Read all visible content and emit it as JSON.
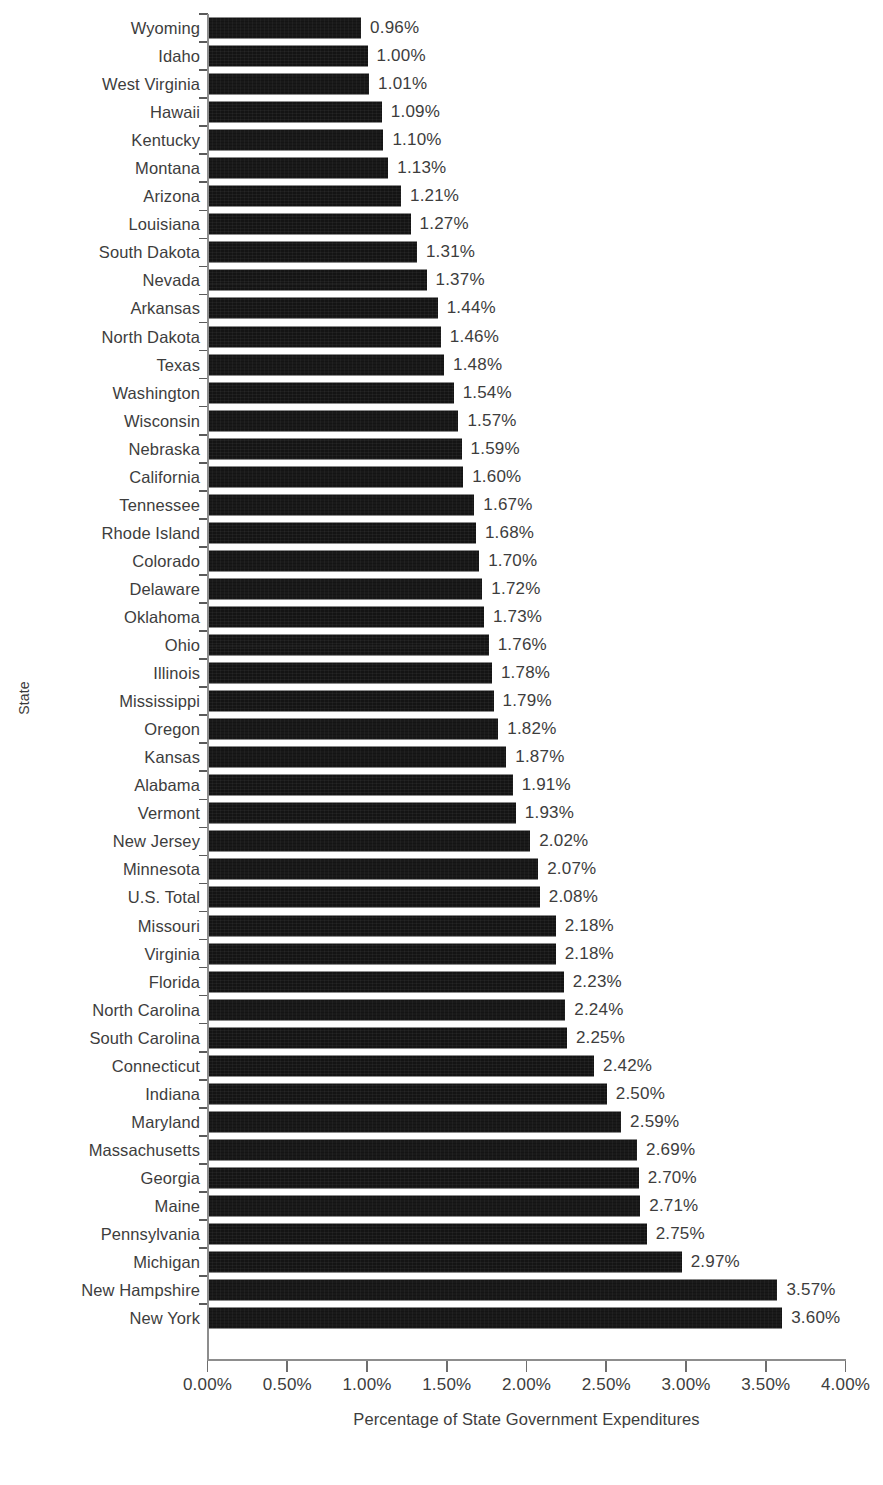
{
  "chart_data": {
    "type": "bar",
    "orientation": "horizontal",
    "title": "",
    "xlabel": "Percentage of State Government Expenditures",
    "ylabel": "State",
    "xlim": [
      0,
      4.0
    ],
    "xtick_labels": [
      "0.00%",
      "0.50%",
      "1.00%",
      "1.50%",
      "2.00%",
      "2.50%",
      "3.00%",
      "3.50%",
      "4.00%"
    ],
    "xticks": [
      0,
      0.5,
      1.0,
      1.5,
      2.0,
      2.5,
      3.0,
      3.5,
      4.0
    ],
    "grid": false,
    "legend": null,
    "bar_color": "#141414",
    "value_label_suffix": "%",
    "categories": [
      "Wyoming",
      "Idaho",
      "West Virginia",
      "Hawaii",
      "Kentucky",
      "Montana",
      "Arizona",
      "Louisiana",
      "South Dakota",
      "Nevada",
      "Arkansas",
      "North Dakota",
      "Texas",
      "Washington",
      "Wisconsin",
      "Nebraska",
      "California",
      "Tennessee",
      "Rhode Island",
      "Colorado",
      "Delaware",
      "Oklahoma",
      "Ohio",
      "Illinois",
      "Mississippi",
      "Oregon",
      "Kansas",
      "Alabama",
      "Vermont",
      "New Jersey",
      "Minnesota",
      "U.S. Total",
      "Missouri",
      "Virginia",
      "Florida",
      "North Carolina",
      "South Carolina",
      "Connecticut",
      "Indiana",
      "Maryland",
      "Massachusetts",
      "Georgia",
      "Maine",
      "Pennsylvania",
      "Michigan",
      "New Hampshire",
      "New York"
    ],
    "values": [
      0.96,
      1.0,
      1.01,
      1.09,
      1.1,
      1.13,
      1.21,
      1.27,
      1.31,
      1.37,
      1.44,
      1.46,
      1.48,
      1.54,
      1.57,
      1.59,
      1.6,
      1.67,
      1.68,
      1.7,
      1.72,
      1.73,
      1.76,
      1.78,
      1.79,
      1.82,
      1.87,
      1.91,
      1.93,
      2.02,
      2.07,
      2.08,
      2.18,
      2.18,
      2.23,
      2.24,
      2.25,
      2.42,
      2.5,
      2.59,
      2.69,
      2.7,
      2.71,
      2.75,
      2.97,
      3.57,
      3.6
    ],
    "value_labels": [
      "0.96%",
      "1.00%",
      "1.01%",
      "1.09%",
      "1.10%",
      "1.13%",
      "1.21%",
      "1.27%",
      "1.31%",
      "1.37%",
      "1.44%",
      "1.46%",
      "1.48%",
      "1.54%",
      "1.57%",
      "1.59%",
      "1.60%",
      "1.67%",
      "1.68%",
      "1.70%",
      "1.72%",
      "1.73%",
      "1.76%",
      "1.78%",
      "1.79%",
      "1.82%",
      "1.87%",
      "1.91%",
      "1.93%",
      "2.02%",
      "2.07%",
      "2.08%",
      "2.18%",
      "2.18%",
      "2.23%",
      "2.24%",
      "2.25%",
      "2.42%",
      "2.50%",
      "2.59%",
      "2.69%",
      "2.70%",
      "2.71%",
      "2.75%",
      "2.97%",
      "3.57%",
      "3.60%"
    ]
  }
}
